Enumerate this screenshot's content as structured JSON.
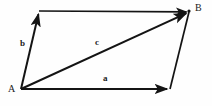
{
  "figure": {
    "type": "vector-parallelogram-diagram",
    "width": 212,
    "height": 106,
    "background_color": "#fefefe",
    "stroke_color": "#141414",
    "text_color": "#1a1a1a"
  },
  "vertices": [
    {
      "name": "A",
      "label": "A",
      "x": 21,
      "y": 89,
      "label_x": 8,
      "label_y": 85
    },
    {
      "name": "B",
      "label": "B",
      "x": 189,
      "y": 12,
      "label_x": 195,
      "label_y": 4
    },
    {
      "name": "top-left",
      "label": "",
      "x": 39,
      "y": 11
    },
    {
      "name": "bottom-right",
      "label": "",
      "x": 170,
      "y": 89
    }
  ],
  "vectors": [
    {
      "name": "vector-a",
      "label": "a",
      "from": {
        "x": 21,
        "y": 89
      },
      "to": {
        "x": 170,
        "y": 89
      },
      "arrow": true,
      "label_x": 103,
      "label_y": 75
    },
    {
      "name": "vector-b",
      "label": "b",
      "from": {
        "x": 21,
        "y": 89
      },
      "to": {
        "x": 39,
        "y": 11
      },
      "arrow": true,
      "label_x": 20,
      "label_y": 40
    },
    {
      "name": "vector-c",
      "label": "c",
      "from": {
        "x": 21,
        "y": 89
      },
      "to": {
        "x": 189,
        "y": 12
      },
      "arrow": true,
      "label_x": 95,
      "label_y": 38
    }
  ],
  "edges": [
    {
      "name": "edge-top",
      "from": {
        "x": 39,
        "y": 11
      },
      "to": {
        "x": 189,
        "y": 12
      },
      "arrow": true
    },
    {
      "name": "edge-right",
      "from": {
        "x": 170,
        "y": 89
      },
      "to": {
        "x": 189,
        "y": 12
      },
      "arrow": false
    }
  ],
  "labels": {
    "vertex_a": "A",
    "vertex_b": "B",
    "side_a": "a",
    "side_b": "b",
    "diagonal_c": "c"
  }
}
